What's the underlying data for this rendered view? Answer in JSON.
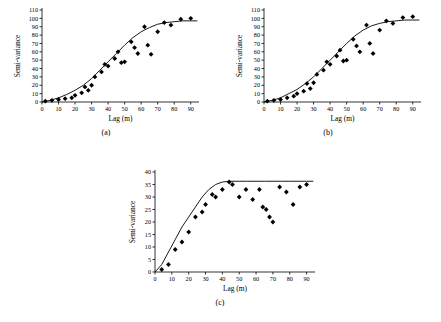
{
  "figure": {
    "panels": [
      {
        "id": "a",
        "caption": "(a)",
        "chart_data": {
          "type": "scatter",
          "title": "",
          "xlabel": "Lag (m)",
          "ylabel": "Semi-variance",
          "xlim": [
            0,
            95
          ],
          "ylim": [
            0,
            110
          ],
          "xticks": [
            0,
            10,
            20,
            30,
            40,
            50,
            60,
            70,
            80,
            90
          ],
          "yticks": [
            0,
            10,
            20,
            30,
            40,
            50,
            60,
            70,
            80,
            90,
            100,
            110
          ],
          "grid": false,
          "legend": null,
          "points": [
            [
              2,
              1
            ],
            [
              6,
              2
            ],
            [
              10,
              3
            ],
            [
              14,
              4
            ],
            [
              18,
              5
            ],
            [
              20,
              8
            ],
            [
              24,
              11
            ],
            [
              26,
              18
            ],
            [
              28,
              14
            ],
            [
              30,
              20
            ],
            [
              32,
              30
            ],
            [
              36,
              36
            ],
            [
              38,
              45
            ],
            [
              40,
              43
            ],
            [
              44,
              52
            ],
            [
              46,
              60
            ],
            [
              48,
              47
            ],
            [
              50,
              48
            ],
            [
              54,
              72
            ],
            [
              56,
              65
            ],
            [
              58,
              58
            ],
            [
              62,
              90
            ],
            [
              64,
              68
            ],
            [
              66,
              57
            ],
            [
              70,
              84
            ],
            [
              74,
              95
            ],
            [
              78,
              92
            ],
            [
              84,
              99
            ],
            [
              90,
              100
            ]
          ],
          "model_curve": {
            "name": "fitted spherical model",
            "x": [
              0,
              5,
              10,
              15,
              20,
              25,
              30,
              35,
              40,
              45,
              50,
              55,
              60,
              65,
              70,
              75,
              80,
              85,
              90,
              94
            ],
            "y": [
              0,
              2,
              5,
              9,
              14,
              20,
              28,
              38,
              48,
              58,
              68,
              77,
              84,
              89,
              93,
              95,
              96,
              97,
              97,
              97
            ]
          }
        }
      },
      {
        "id": "b",
        "caption": "(b)",
        "chart_data": {
          "type": "scatter",
          "title": "",
          "xlabel": "Lag (m)",
          "ylabel": "Semi-variance",
          "xlim": [
            0,
            95
          ],
          "ylim": [
            0,
            110
          ],
          "xticks": [
            0,
            10,
            20,
            30,
            40,
            50,
            60,
            70,
            80,
            90
          ],
          "yticks": [
            0,
            10,
            20,
            30,
            40,
            50,
            60,
            70,
            80,
            90,
            100,
            110
          ],
          "grid": false,
          "legend": null,
          "points": [
            [
              2,
              1
            ],
            [
              6,
              2
            ],
            [
              10,
              3
            ],
            [
              14,
              5
            ],
            [
              18,
              7
            ],
            [
              20,
              10
            ],
            [
              24,
              13
            ],
            [
              26,
              22
            ],
            [
              28,
              16
            ],
            [
              30,
              23
            ],
            [
              32,
              33
            ],
            [
              36,
              38
            ],
            [
              38,
              48
            ],
            [
              40,
              45
            ],
            [
              44,
              55
            ],
            [
              46,
              62
            ],
            [
              48,
              49
            ],
            [
              50,
              50
            ],
            [
              54,
              75
            ],
            [
              56,
              67
            ],
            [
              58,
              60
            ],
            [
              62,
              92
            ],
            [
              64,
              70
            ],
            [
              66,
              58
            ],
            [
              70,
              86
            ],
            [
              74,
              97
            ],
            [
              78,
              94
            ],
            [
              84,
              101
            ],
            [
              90,
              102
            ]
          ],
          "model_curve": {
            "name": "fitted spherical model",
            "x": [
              0,
              5,
              10,
              15,
              20,
              25,
              30,
              35,
              40,
              45,
              50,
              55,
              60,
              65,
              70,
              75,
              80,
              85,
              90,
              94
            ],
            "y": [
              0,
              2,
              5,
              10,
              15,
              22,
              30,
              40,
              50,
              60,
              70,
              79,
              86,
              91,
              94,
              96,
              97,
              98,
              98,
              98
            ]
          }
        }
      },
      {
        "id": "c",
        "caption": "(c)",
        "chart_data": {
          "type": "scatter",
          "title": "",
          "xlabel": "Lag (m)",
          "ylabel": "Semi-variance",
          "xlim": [
            0,
            95
          ],
          "ylim": [
            0,
            40
          ],
          "xticks": [
            0,
            10,
            20,
            30,
            40,
            50,
            60,
            70,
            80,
            90
          ],
          "yticks": [
            0,
            5,
            10,
            15,
            20,
            25,
            30,
            35,
            40
          ],
          "grid": false,
          "legend": null,
          "points": [
            [
              4,
              1
            ],
            [
              8,
              3
            ],
            [
              12,
              9
            ],
            [
              16,
              12
            ],
            [
              20,
              16
            ],
            [
              24,
              22
            ],
            [
              28,
              24
            ],
            [
              30,
              27
            ],
            [
              34,
              31
            ],
            [
              36,
              30
            ],
            [
              40,
              33
            ],
            [
              44,
              36
            ],
            [
              46,
              35
            ],
            [
              50,
              30
            ],
            [
              54,
              33
            ],
            [
              58,
              29
            ],
            [
              62,
              33
            ],
            [
              64,
              26
            ],
            [
              66,
              25
            ],
            [
              68,
              22
            ],
            [
              70,
              20
            ],
            [
              74,
              34
            ],
            [
              78,
              32
            ],
            [
              82,
              27
            ],
            [
              86,
              34
            ],
            [
              90,
              35
            ]
          ],
          "model_curve": {
            "name": "fitted spherical model",
            "x": [
              0,
              4,
              8,
              12,
              16,
              20,
              24,
              28,
              32,
              36,
              40,
              45,
              50,
              55,
              60,
              65,
              70,
              75,
              80,
              85,
              90,
              94
            ],
            "y": [
              0,
              3,
              8,
              13,
              18,
              22,
              26,
              30,
              33,
              35,
              36,
              36.3,
              36.3,
              36.3,
              36.3,
              36.3,
              36.3,
              36.3,
              36.3,
              36.3,
              36.3,
              36.3
            ]
          }
        }
      }
    ]
  }
}
